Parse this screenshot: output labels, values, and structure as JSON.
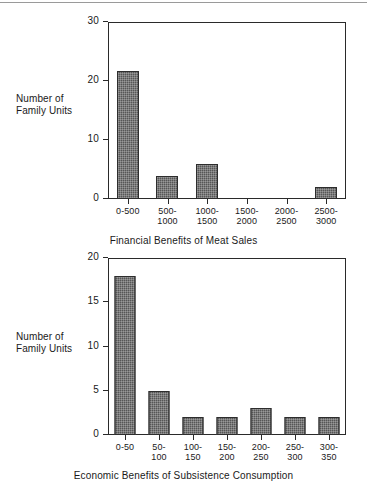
{
  "page": {
    "top_rule": "horizontal-rule",
    "background_color": "#ffffff",
    "bar_color": "#565656",
    "axis_color": "#2a2a2a"
  },
  "chart_data": [
    {
      "type": "bar",
      "id": "financial-benefits-of-meat-sales",
      "title": "",
      "xlabel": "Financial Benefits of Meat Sales",
      "ylabel": "Number of\nFamily Units",
      "ylabel_line1": "Number of",
      "ylabel_line2": "Family Units",
      "categories": [
        "0-500",
        "500-\n1000",
        "1000-\n1500",
        "1500-\n2000",
        "2000-\n2500",
        "2500-\n3000"
      ],
      "values": [
        21.7,
        3.9,
        6.0,
        0,
        0,
        2.0
      ],
      "ylim": [
        0,
        30
      ],
      "yticks": [
        0,
        10,
        20,
        30
      ],
      "ytick_labels": [
        "0",
        "10",
        "20",
        "30"
      ],
      "grid": false,
      "legend": "none"
    },
    {
      "type": "bar",
      "id": "economic-benefits-of-subsistence-consumption",
      "title": "",
      "xlabel": "Economic Benefits of Subsistence Consumption",
      "ylabel": "Number of\nFamily Units",
      "ylabel_line1": "Number of",
      "ylabel_line2": "Family Units",
      "categories": [
        "0-50",
        "50-\n100",
        "100-\n150",
        "150-\n200",
        "200-\n250",
        "250-\n300",
        "300-\n350"
      ],
      "values": [
        18,
        5,
        2,
        2,
        3,
        2,
        2
      ],
      "ylim": [
        0,
        20
      ],
      "yticks": [
        0,
        5,
        10,
        15,
        20
      ],
      "ytick_labels": [
        "0",
        "5",
        "10",
        "15",
        "20"
      ],
      "grid": false,
      "legend": "none"
    }
  ]
}
